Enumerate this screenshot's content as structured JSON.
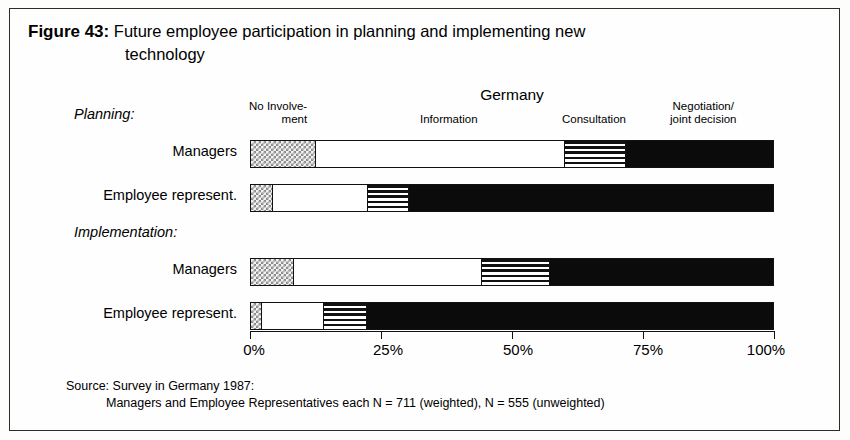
{
  "figure": {
    "number_label": "Figure 43:",
    "title_line1": "Future employee participation in planning and implementing new",
    "title_line2": "technology",
    "country_heading": "Germany"
  },
  "source": {
    "line1": "Source: Survey in Germany 1987:",
    "line2": "Managers and Employee Representatives each N = 711 (weighted), N = 555 (unweighted)"
  },
  "groups": {
    "planning": "Planning:",
    "implementation": "Implementation:"
  },
  "row_labels": {
    "r0": "Managers",
    "r1": "Employee represent.",
    "r2": "Managers",
    "r3": "Employee represent."
  },
  "legend": {
    "no_involvement_line1": "No Involve-",
    "no_involvement_line2": "ment",
    "information": "Information",
    "consultation": "Consultation",
    "negotiation_line1": "Negotiation/",
    "negotiation_line2": "joint decision"
  },
  "axis": {
    "tick_0": "0%",
    "tick_1": "25%",
    "tick_2": "50%",
    "tick_3": "75%",
    "tick_4": "100%"
  },
  "colors": {
    "no_involvement": "#c9c9c9",
    "information": "#ffffff",
    "consultation": "#7a7a7a",
    "negotiation": "#0b0b0b",
    "outline": "#111111",
    "page_background": "#fefefe"
  },
  "chart_data": {
    "type": "bar",
    "orientation": "horizontal",
    "stacked": true,
    "normalized_percent": true,
    "title": "Future employee participation in planning and implementing new technology",
    "subtitle": "Germany",
    "xlabel": "",
    "ylabel": "",
    "xlim": [
      0,
      100
    ],
    "xticks": [
      0,
      25,
      50,
      75,
      100
    ],
    "xtick_labels": [
      "0%",
      "25%",
      "50%",
      "75%",
      "100%"
    ],
    "grid": false,
    "legend_position": "top",
    "categories": [
      "Planning – Managers",
      "Planning – Employee represent.",
      "Implementation – Managers",
      "Implementation – Employee represent."
    ],
    "series": [
      {
        "name": "No Involvement",
        "fill": "checkerboard",
        "values": [
          12.4,
          4.2,
          8.2,
          2.1
        ]
      },
      {
        "name": "Information",
        "fill": "white",
        "values": [
          47.7,
          18.3,
          36.1,
          11.8
        ]
      },
      {
        "name": "Consultation",
        "fill": "horizontal-stripes",
        "values": [
          11.7,
          7.8,
          13.0,
          8.4
        ]
      },
      {
        "name": "Negotiation/joint decision",
        "fill": "solid-black",
        "values": [
          28.2,
          69.7,
          42.7,
          77.7
        ]
      }
    ],
    "cumulative_boundaries": [
      [
        12.4,
        60.1,
        71.8,
        100
      ],
      [
        4.2,
        22.5,
        30.3,
        100
      ],
      [
        8.2,
        44.3,
        57.3,
        100
      ],
      [
        2.1,
        13.9,
        22.3,
        100
      ]
    ],
    "annotations": [
      "Source: Survey in Germany 1987:",
      "Managers and Employee Representatives each N = 711 (weighted), N = 555 (unweighted)"
    ]
  }
}
